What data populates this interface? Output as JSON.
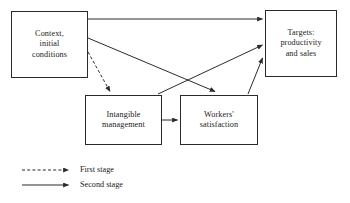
{
  "diagram": {
    "type": "flow-diagram",
    "nodes": [
      {
        "id": "context",
        "label": "Context,\ninitial\nconditions"
      },
      {
        "id": "targets",
        "label": "Targets:\nproductivity\nand sales"
      },
      {
        "id": "intangible",
        "label": "Intangible\nmanagement"
      },
      {
        "id": "workers",
        "label": "Workers'\nsatisfaction"
      }
    ],
    "edges": [
      {
        "from": "context",
        "to": "targets",
        "stage": "second",
        "style": "solid",
        "path": "horizontal-top"
      },
      {
        "from": "context",
        "to": "workers",
        "stage": "second",
        "style": "solid",
        "path": "diagonal-down-right"
      },
      {
        "from": "context",
        "to": "intangible",
        "stage": "first",
        "style": "dashed",
        "path": "diagonal-down-right"
      },
      {
        "from": "intangible",
        "to": "workers",
        "stage": "second",
        "style": "solid",
        "path": "horizontal-middle"
      },
      {
        "from": "intangible",
        "to": "targets",
        "stage": "second",
        "style": "solid",
        "path": "diagonal-up-right"
      },
      {
        "from": "workers",
        "to": "targets",
        "stage": "second",
        "style": "solid",
        "path": "diagonal-up-right"
      }
    ]
  },
  "legend": {
    "first_stage_label": "First stage",
    "second_stage_label": "Second stage"
  },
  "colors": {
    "stroke": "#2b2b2b",
    "background": "#ffffff",
    "text": "#1a1a1a"
  }
}
